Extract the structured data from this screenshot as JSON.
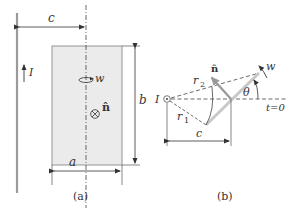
{
  "figure_a": {
    "caption": "(a)",
    "labels": {
      "c": "c",
      "I": "I",
      "w": "w",
      "n_hat": "n̂",
      "b": "b",
      "a": "a"
    },
    "colors": {
      "loop_fill": "#ebebeb",
      "wire": "#9a9a9a",
      "line": "#333333"
    }
  },
  "figure_b": {
    "caption": "(b)",
    "labels": {
      "I": "I",
      "r1": "r",
      "r1_sub": "1",
      "r2": "r",
      "r2_sub": "2",
      "n_hat": "n̂",
      "w": "w",
      "theta": "θ",
      "t0": "t=0",
      "c": "c"
    },
    "colors": {
      "loop_edge": "#c8c8c8",
      "line": "#333333"
    }
  }
}
